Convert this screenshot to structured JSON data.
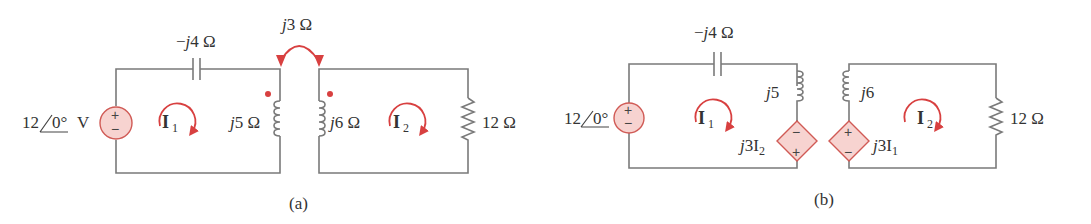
{
  "figure_a": {
    "caption": "(a)",
    "source": {
      "magnitude": "12",
      "angle": "0°",
      "unit": "V",
      "plus": "+",
      "minus": "−"
    },
    "capacitor": {
      "prefix": "−",
      "j": "j",
      "value": "4 Ω"
    },
    "mutual": {
      "j": "j",
      "value": "3 Ω"
    },
    "inductor1": {
      "j": "j",
      "value": "5 Ω"
    },
    "inductor2": {
      "j": "j",
      "value": "6 Ω"
    },
    "resistor": {
      "value": "12 Ω"
    },
    "mesh1": {
      "label": "I",
      "sub": "1"
    },
    "mesh2": {
      "label": "I",
      "sub": "2"
    }
  },
  "figure_b": {
    "caption": "(b)",
    "source": {
      "magnitude": "12",
      "angle": "0°",
      "plus": "+",
      "minus": "−"
    },
    "capacitor": {
      "prefix": "−",
      "j": "j",
      "value": "4 Ω"
    },
    "inductor1": {
      "j": "j",
      "value": "5"
    },
    "inductor2": {
      "j": "j",
      "value": "6"
    },
    "dep_source1": {
      "j": "j",
      "coef": "3I",
      "sub": "2",
      "top": "−",
      "bottom": "+"
    },
    "dep_source2": {
      "j": "j",
      "coef": "3I",
      "sub": "1",
      "top": "+",
      "bottom": "−"
    },
    "resistor": {
      "value": "12 Ω"
    },
    "mesh1": {
      "label": "I",
      "sub": "1"
    },
    "mesh2": {
      "label": "I",
      "sub": "2"
    }
  },
  "colors": {
    "wire": "#7a7a7a",
    "accent": "#d84040",
    "source_fill": "#f7d3d0"
  }
}
